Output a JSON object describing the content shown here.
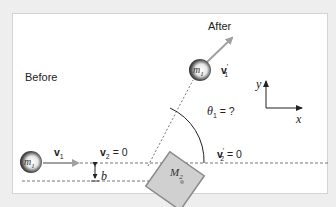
{
  "labels": {
    "before": "Before",
    "after": "After",
    "v1": "v",
    "v1_sub": "1",
    "v2_eq": "v",
    "v2_sub": "2",
    "v2_rest": " = 0",
    "v1p": "v",
    "v1p_sub": "1",
    "v1p_prime": "′",
    "v2p": "v",
    "v2p_sub": "2",
    "v2p_prime": "′",
    "v2p_rest": " = 0",
    "b": "b",
    "m1": "m",
    "m1_sub": "1",
    "m1p": "m",
    "m1p_sub": "1",
    "M2": "M",
    "M2_sub": "2",
    "theta": "θ",
    "theta_sub": "1",
    "theta_rest": " = ?",
    "axis_x": "x",
    "axis_y": "y"
  },
  "colors": {
    "background": "#eeeeee",
    "panel": "#ffffff",
    "arrow": "#a0a0a0",
    "box_fill": "#d0d0d0",
    "box_stroke": "#8a8a8a",
    "dash": "#777777",
    "ball_dark": "#222222"
  }
}
